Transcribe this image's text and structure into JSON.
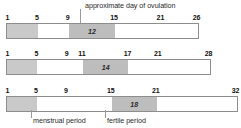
{
  "figure": {
    "type": "diagram"
  },
  "annotations": {
    "ovulation": "approximate day of ovulation",
    "menstrual": "menstrual period",
    "fertile": "fertile period"
  },
  "colors": {
    "menstrual_segment": "#c9c9c9",
    "fertile_segment": "#bdbdbd",
    "bar_border": "#8d8d8d",
    "leader_line": "#9a9a9a",
    "background": "#ffffff",
    "text": "#111111"
  },
  "chart_data": {
    "type": "bar",
    "title": "approximate day of ovulation",
    "xlabel": "",
    "ylabel": "",
    "rows": [
      {
        "cycle_length": 26,
        "tick_labels": [
          "1",
          "5",
          "9",
          "15",
          "21",
          "26"
        ],
        "tick_days": [
          1,
          5,
          9,
          15,
          21,
          26
        ],
        "menstrual_period": {
          "start": 1,
          "end": 5
        },
        "fertile_period": {
          "start": 9,
          "end": 15
        },
        "ovulation_day": "12"
      },
      {
        "cycle_length": 28,
        "tick_labels": [
          "1",
          "5",
          "9",
          "11",
          "17",
          "21",
          "28"
        ],
        "tick_days": [
          1,
          5,
          9,
          11,
          17,
          21,
          28
        ],
        "menstrual_period": {
          "start": 1,
          "end": 5
        },
        "fertile_period": {
          "start": 11,
          "end": 17
        },
        "ovulation_day": "14"
      },
      {
        "cycle_length": 32,
        "tick_labels": [
          "1",
          "5",
          "9",
          "15",
          "21",
          "32"
        ],
        "tick_days": [
          1,
          5,
          9,
          15,
          21,
          32
        ],
        "menstrual_period": {
          "start": 1,
          "end": 5
        },
        "fertile_period": {
          "start": 15,
          "end": 21
        },
        "ovulation_day": "18"
      }
    ]
  }
}
